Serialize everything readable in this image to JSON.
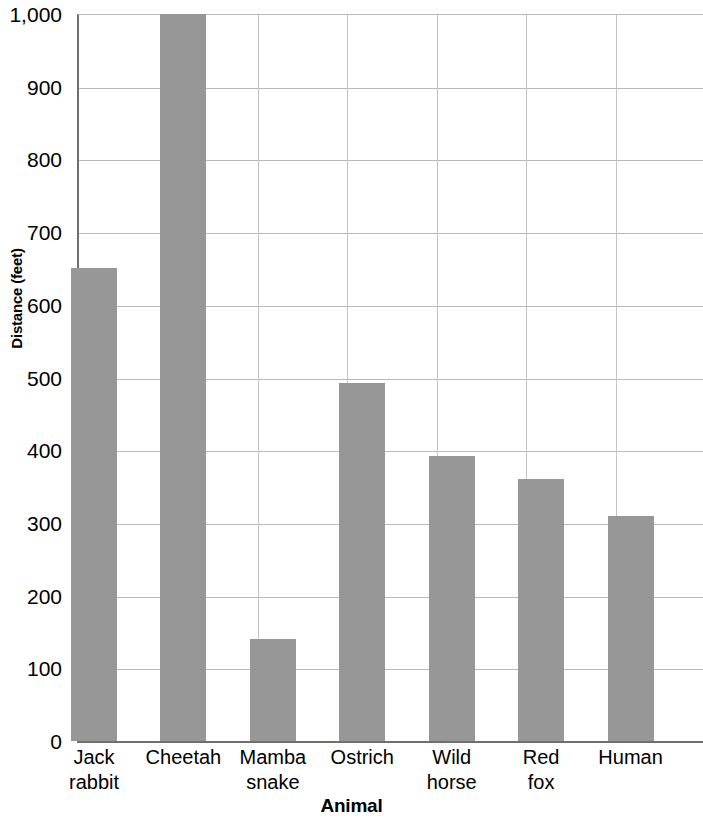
{
  "chart_data": {
    "type": "bar",
    "title": "",
    "xlabel": "Animal",
    "ylabel": "Distance (feet)",
    "categories": [
      "Jack rabbit",
      "Cheetah",
      "Mamba snake",
      "Ostrich",
      "Wild horse",
      "Red fox",
      "Human"
    ],
    "category_labels_wrapped": [
      "Jack\nrabbit",
      "Cheetah",
      "Mamba\nsnake",
      "Ostrich",
      "Wild\nhorse",
      "Red\nfox",
      "Human"
    ],
    "values": [
      650,
      1000,
      140,
      493,
      392,
      360,
      310
    ],
    "ylim": [
      0,
      1000
    ],
    "ytick_values": [
      0,
      100,
      200,
      300,
      400,
      500,
      600,
      700,
      800,
      900,
      1000
    ],
    "ytick_labels": [
      "0",
      "100",
      "200",
      "300",
      "400",
      "500",
      "600",
      "700",
      "800",
      "900",
      "1,000"
    ],
    "grid": true,
    "legend": "none",
    "bar_color": "#979797",
    "gridline_color": "#b9b9b9",
    "axis_color": "#6f6f6f"
  }
}
